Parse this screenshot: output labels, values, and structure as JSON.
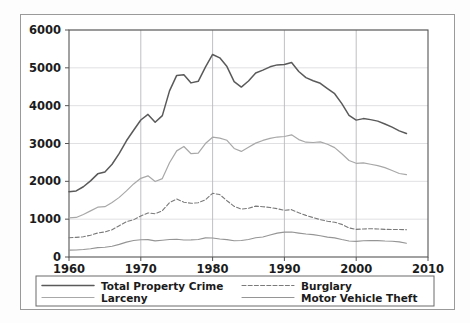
{
  "figure": {
    "background_color": "#ffffff",
    "border_color": "#9a9a9a"
  },
  "chart_data": {
    "type": "line",
    "title": "",
    "xlabel": "",
    "ylabel": "",
    "xlim": [
      1960,
      2010
    ],
    "ylim": [
      0,
      6000
    ],
    "grid": true,
    "legend_position": "below-axes",
    "xticks": [
      1960,
      1970,
      1980,
      1990,
      2000,
      2010
    ],
    "xtick_labels": [
      "1960",
      "1970",
      "1980",
      "1990",
      "2000",
      "2010"
    ],
    "yticks": [
      0,
      1000,
      2000,
      3000,
      4000,
      5000,
      6000
    ],
    "ytick_labels": [
      "0",
      "1000",
      "2000",
      "3000",
      "4000",
      "5000",
      "6000"
    ],
    "x": [
      1960,
      1961,
      1962,
      1963,
      1964,
      1965,
      1966,
      1967,
      1968,
      1969,
      1970,
      1971,
      1972,
      1973,
      1974,
      1975,
      1976,
      1977,
      1978,
      1979,
      1980,
      1981,
      1982,
      1983,
      1984,
      1985,
      1986,
      1987,
      1988,
      1989,
      1990,
      1991,
      1992,
      1993,
      1994,
      1995,
      1996,
      1997,
      1998,
      1999,
      2000,
      2001,
      2002,
      2003,
      2004,
      2005,
      2006,
      2007
    ],
    "series": [
      {
        "name": "Total Property Crime",
        "color": "#5a5a5a",
        "style": "solid",
        "width": 1.5,
        "values": [
          1726,
          1747,
          1857,
          2012,
          2198,
          2249,
          2451,
          2737,
          3072,
          3351,
          3621,
          3769,
          3561,
          3737,
          4390,
          4800,
          4820,
          4602,
          4643,
          5017,
          5353,
          5264,
          5033,
          4637,
          4492,
          4651,
          4863,
          4940,
          5027,
          5078,
          5088,
          5140,
          4903,
          4740,
          4660,
          4591,
          4451,
          4316,
          4053,
          3744,
          3618,
          3658,
          3631,
          3591,
          3514,
          3432,
          3335,
          3264
        ]
      },
      {
        "name": "Burglary",
        "color": "#7a7a7a",
        "style": "dashed",
        "width": 1.1,
        "values": [
          509,
          519,
          535,
          576,
          635,
          663,
          721,
          827,
          932,
          984,
          1085,
          1164,
          1141,
          1223,
          1438,
          1532,
          1448,
          1420,
          1434,
          1512,
          1684,
          1650,
          1488,
          1338,
          1264,
          1287,
          1345,
          1330,
          1309,
          1276,
          1236,
          1252,
          1168,
          1100,
          1042,
          987,
          945,
          919,
          863,
          770,
          729,
          741,
          747,
          741,
          730,
          727,
          729,
          722
        ]
      },
      {
        "name": "Larceny",
        "color": "#a8a8a8",
        "style": "solid",
        "width": 1.2,
        "values": [
          1035,
          1046,
          1125,
          1219,
          1316,
          1330,
          1443,
          1576,
          1747,
          1931,
          2079,
          2146,
          1994,
          2072,
          2490,
          2805,
          2921,
          2730,
          2744,
          2999,
          3167,
          3140,
          3085,
          2869,
          2791,
          2901,
          3010,
          3081,
          3135,
          3171,
          3185,
          3229,
          3103,
          3034,
          3026,
          3044,
          2980,
          2892,
          2729,
          2551,
          2477,
          2486,
          2451,
          2416,
          2362,
          2287,
          2207,
          2178
        ]
      },
      {
        "name": "Motor Vehicle Theft",
        "color": "#959595",
        "style": "solid",
        "width": 1.1,
        "values": [
          183,
          184,
          197,
          217,
          247,
          257,
          286,
          334,
          393,
          436,
          457,
          460,
          426,
          443,
          462,
          469,
          450,
          452,
          461,
          506,
          502,
          475,
          459,
          431,
          437,
          463,
          508,
          529,
          583,
          631,
          657,
          659,
          632,
          606,
          592,
          560,
          526,
          506,
          462,
          423,
          412,
          431,
          433,
          433,
          422,
          417,
          399,
          364
        ]
      }
    ]
  },
  "legend": {
    "entries": [
      {
        "label": "Total Property Crime"
      },
      {
        "label": "Burglary"
      },
      {
        "label": "Larceny"
      },
      {
        "label": "Motor Vehicle Theft"
      }
    ]
  }
}
